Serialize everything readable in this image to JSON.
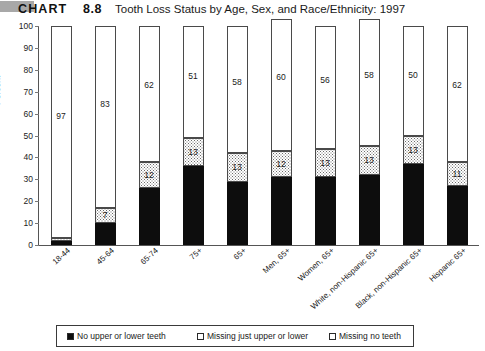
{
  "header": {
    "gray_tab": "",
    "chart_word": "CHART",
    "chart_number": "8.8",
    "title": "Tooth Loss Status by Age, Sex, and Race/Ethnicity: 1997"
  },
  "chart_data": {
    "type": "bar",
    "subtype": "stacked-bar-100",
    "title": "Tooth Loss Status by Age, Sex, and Race/Ethnicity: 1997",
    "xlabel": "",
    "ylabel": "Percent",
    "ylim": [
      0,
      100
    ],
    "yticks": [
      0,
      10,
      20,
      30,
      40,
      50,
      60,
      70,
      80,
      90,
      100
    ],
    "grid": false,
    "legend_position": "bottom",
    "categories": [
      "18-44",
      "45-64",
      "65-74",
      "75+",
      "65+",
      "Men, 65+",
      "Women, 65+",
      "White, non-Hispanic 65+",
      "Black, non-Hispanic 65+",
      "Hispanic 65+"
    ],
    "series": [
      {
        "name": "No upper or lower teeth",
        "fill": "black",
        "color": "#0d0d0d",
        "values": [
          2,
          10,
          26,
          36,
          29,
          31,
          31,
          32,
          37,
          27
        ],
        "labels": [
          "",
          "",
          "",
          "",
          "",
          "",
          "",
          "",
          "",
          ""
        ]
      },
      {
        "name": "Missing just upper or lower",
        "fill": "dotted",
        "color": "#ffffff",
        "values": [
          1,
          7,
          12,
          13,
          13,
          12,
          13,
          13,
          13,
          11
        ],
        "labels": [
          "",
          "7",
          "12",
          "13",
          "13",
          "12",
          "13",
          "13",
          "13",
          "11"
        ]
      },
      {
        "name": "Missing no teeth",
        "fill": "white",
        "color": "#ffffff",
        "values": [
          97,
          83,
          62,
          51,
          58,
          60,
          56,
          58,
          50,
          62
        ],
        "labels": [
          "97",
          "83",
          "62",
          "51",
          "58",
          "60",
          "56",
          "58",
          "50",
          "62"
        ]
      }
    ]
  },
  "legend": {
    "items": [
      {
        "label": "No upper or lower teeth",
        "swatch": "black"
      },
      {
        "label": "Missing just upper or lower",
        "swatch": "dotted"
      },
      {
        "label": "Missing no teeth",
        "swatch": "white"
      }
    ]
  }
}
